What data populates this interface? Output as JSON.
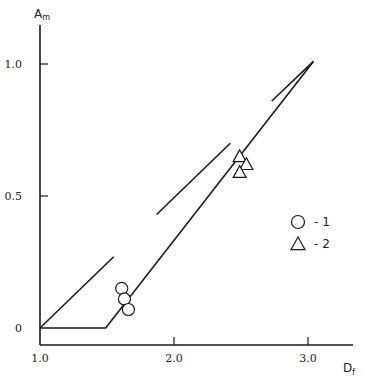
{
  "chart_data": {
    "type": "line",
    "title": "",
    "xlabel": "D",
    "xlabel_sub": "f",
    "ylabel": "A",
    "ylabel_sub": "m",
    "xlim": [
      1.0,
      3.2
    ],
    "ylim": [
      -0.06,
      1.1
    ],
    "x_ticks": [
      {
        "value": 1.0,
        "label": "1.0"
      },
      {
        "value": 2.0,
        "label": "2.0"
      },
      {
        "value": 3.0,
        "label": "3.0"
      }
    ],
    "y_ticks": [
      {
        "value": 0,
        "label": "0"
      },
      {
        "value": 0.5,
        "label": "0.5"
      },
      {
        "value": 1.0,
        "label": "1.0"
      }
    ],
    "grid": false,
    "lines": [
      {
        "name": "main-curve",
        "points": [
          [
            1.0,
            0.0
          ],
          [
            1.49,
            0.0
          ],
          [
            3.04,
            1.01
          ]
        ]
      },
      {
        "name": "left-bound-line",
        "points": [
          [
            1.0,
            0.0
          ],
          [
            1.55,
            0.27
          ]
        ]
      },
      {
        "name": "middle-bound-segment",
        "points": [
          [
            1.87,
            0.43
          ],
          [
            2.42,
            0.7
          ]
        ]
      },
      {
        "name": "upper-bound-segment",
        "points": [
          [
            2.73,
            0.86
          ],
          [
            3.04,
            1.01
          ]
        ]
      }
    ],
    "series": [
      {
        "name": "1",
        "marker": "circle",
        "points": [
          [
            1.61,
            0.15
          ],
          [
            1.63,
            0.11
          ],
          [
            1.66,
            0.07
          ]
        ]
      },
      {
        "name": "2",
        "marker": "triangle",
        "points": [
          [
            2.49,
            0.65
          ],
          [
            2.54,
            0.62
          ],
          [
            2.49,
            0.59
          ]
        ]
      }
    ],
    "legend": {
      "position": "right-middle",
      "entries": [
        {
          "marker": "circle",
          "label": "- 1"
        },
        {
          "marker": "triangle",
          "label": "- 2"
        }
      ]
    }
  }
}
